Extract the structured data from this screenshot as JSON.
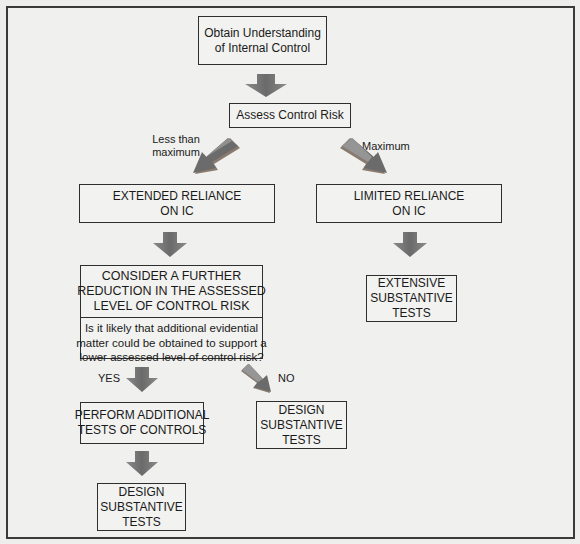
{
  "diagram": {
    "nodes": {
      "obtain_understanding": {
        "lines": [
          "Obtain Understanding",
          "of Internal Control"
        ]
      },
      "assess_control_risk": {
        "lines": [
          "Assess Control Risk"
        ]
      },
      "extended_reliance": {
        "lines": [
          "EXTENDED RELIANCE",
          "ON IC"
        ]
      },
      "limited_reliance": {
        "lines": [
          "LIMITED RELIANCE",
          "ON IC"
        ]
      },
      "consider_reduction": {
        "heading_lines": [
          "CONSIDER A FURTHER",
          "REDUCTION IN THE ASSESSED",
          "LEVEL OF CONTROL RISK"
        ],
        "question_lines": [
          "Is it likely that additional evidential",
          "matter could be obtained to support a",
          "lower assessed level of control risk?"
        ]
      },
      "extensive_substantive": {
        "lines": [
          "EXTENSIVE",
          "SUBSTANTIVE",
          "TESTS"
        ]
      },
      "perform_additional": {
        "lines": [
          "PERFORM ADDITIONAL",
          "TESTS OF CONTROLS"
        ]
      },
      "design_substantive_no": {
        "lines": [
          "DESIGN",
          "SUBSTANTIVE",
          "TESTS"
        ]
      },
      "design_substantive_yes": {
        "lines": [
          "DESIGN",
          "SUBSTANTIVE",
          "TESTS"
        ]
      }
    },
    "edge_labels": {
      "less_than_maximum": [
        "Less than",
        "maximum"
      ],
      "maximum": "Maximum",
      "yes": "YES",
      "no": "NO"
    },
    "edges": [
      {
        "from": "obtain_understanding",
        "to": "assess_control_risk"
      },
      {
        "from": "assess_control_risk",
        "to": "extended_reliance",
        "label": "Less than maximum"
      },
      {
        "from": "assess_control_risk",
        "to": "limited_reliance",
        "label": "Maximum"
      },
      {
        "from": "extended_reliance",
        "to": "consider_reduction"
      },
      {
        "from": "limited_reliance",
        "to": "extensive_substantive"
      },
      {
        "from": "consider_reduction",
        "to": "perform_additional",
        "label": "YES"
      },
      {
        "from": "consider_reduction",
        "to": "design_substantive_no",
        "label": "NO"
      },
      {
        "from": "perform_additional",
        "to": "design_substantive_yes"
      }
    ],
    "colors": {
      "arrow_dark": "#6e6e6e",
      "arrow_light": "#9a9a9a",
      "arrow_shadow": "#8a7b6e",
      "border": "#2e2e2e",
      "background": "#f0f0ee"
    }
  }
}
